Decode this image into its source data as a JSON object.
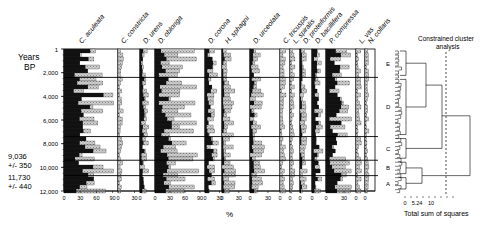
{
  "chart_data": {
    "type": "area",
    "subtype": "stratigraphic-diagram",
    "title": "",
    "ylabel": "Years BP",
    "xlabel": "%",
    "ylim": [
      1,
      12000
    ],
    "y_ticks": [
      "1",
      "2,000",
      "4,000",
      "6,000",
      "8,000",
      "10,000",
      "12,000"
    ],
    "y_tick_values": [
      1,
      2000,
      4000,
      6000,
      8000,
      10000,
      12000
    ],
    "dates": [
      {
        "label": "9,036",
        "error": "+/- 350",
        "age": 9800
      },
      {
        "label": "11,730",
        "error": "+/- 440",
        "age": 11500
      }
    ],
    "taxa": [
      {
        "name": "C. aculeata",
        "ticks": [
          "0",
          "30",
          "60",
          "90"
        ],
        "max": 100
      },
      {
        "name": "C. constricta",
        "ticks": [
          "0",
          "30"
        ],
        "max": 40
      },
      {
        "name": "D. urens",
        "ticks": [
          "0"
        ],
        "max": 25
      },
      {
        "name": "D. oblonga",
        "ticks": [
          "0",
          "30",
          "60",
          "90"
        ],
        "max": 100
      },
      {
        "name": "D. corona",
        "ticks": [
          "0",
          "30"
        ],
        "max": 35
      },
      {
        "name": "H. sphagni",
        "ticks": [
          "0",
          "30"
        ],
        "max": 50
      },
      {
        "name": "D. urceolata",
        "ticks": [
          "0",
          "30"
        ],
        "max": 50
      },
      {
        "name": "C. tricuspis",
        "ticks": [
          "0"
        ],
        "max": 20
      },
      {
        "name": "L. spiralis",
        "ticks": [
          "0"
        ],
        "max": 20
      },
      {
        "name": "D. proteiformis",
        "ticks": [
          "0"
        ],
        "max": 20
      },
      {
        "name": "D. bacillifera",
        "ticks": [
          "0"
        ],
        "max": 25
      },
      {
        "name": "P. compressa",
        "ticks": [
          "0",
          "30"
        ],
        "max": 50
      },
      {
        "name": "L. vas",
        "ticks": [
          "0"
        ],
        "max": 15
      },
      {
        "name": "N. collaris",
        "ticks": [
          "0"
        ],
        "max": 15
      }
    ],
    "zones": [
      {
        "label": "E",
        "from": 1,
        "to": 2400
      },
      {
        "label": "D",
        "from": 2400,
        "to": 7400
      },
      {
        "label": "C",
        "from": 7400,
        "to": 9400
      },
      {
        "label": "B",
        "from": 9400,
        "to": 10700
      },
      {
        "label": "A",
        "from": 10700,
        "to": 12000
      }
    ],
    "cluster": {
      "title": "Constrained cluster analysis",
      "xlabel": "Total sum of squares",
      "x_ticks": [
        "0",
        "5.24",
        "10"
      ],
      "cutoff": 5.24
    },
    "legend": {
      "dark": "black fill (exaggeration-free values)",
      "light": "stippled fill"
    }
  },
  "labels": {
    "years": "Years",
    "bp": "BP",
    "percent": "%",
    "cluster_title_1": "Constrained cluster",
    "cluster_title_2": "analysis",
    "cluster_xlabel": "Total sum of squares"
  }
}
